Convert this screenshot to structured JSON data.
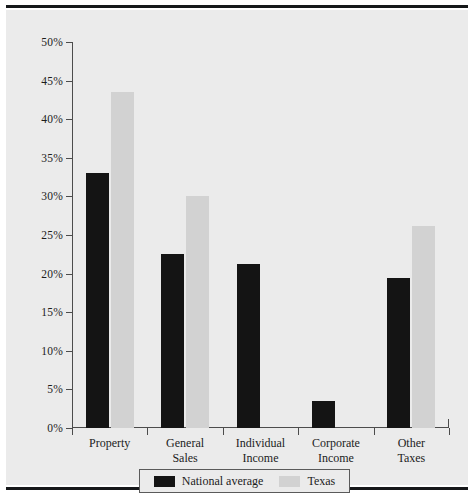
{
  "chart_data": {
    "type": "bar",
    "title": "",
    "subtitle": "",
    "xlabel": "",
    "ylabel": "",
    "categories": [
      "Property",
      "General Sales",
      "Individual Income",
      "Corporate Income",
      "Other Taxes"
    ],
    "category_lines": [
      [
        "Property"
      ],
      [
        "General",
        "Sales"
      ],
      [
        "Individual",
        "Income"
      ],
      [
        "Corporate",
        "Income"
      ],
      [
        "Other",
        "Taxes"
      ]
    ],
    "series": [
      {
        "name": "National average",
        "color": "#141414",
        "values": [
          33.0,
          22.5,
          21.3,
          3.5,
          19.4
        ]
      },
      {
        "name": "Texas",
        "color": "#d2d2d2",
        "values": [
          43.5,
          30.0,
          0,
          0,
          26.2
        ]
      }
    ],
    "ylim": [
      0,
      50
    ],
    "ytick_values": [
      0,
      5,
      10,
      15,
      20,
      25,
      30,
      35,
      40,
      45,
      50
    ],
    "ytick_labels": [
      "0%",
      "5%",
      "10%",
      "15%",
      "20%",
      "25%",
      "30%",
      "35%",
      "40%",
      "45%",
      "50%"
    ],
    "grid": false,
    "legend_position": "bottom",
    "value_suffix": "%"
  },
  "legend": {
    "entries": [
      {
        "label": "National average",
        "swatch": "nat"
      },
      {
        "label": "Texas",
        "swatch": "tex"
      }
    ]
  },
  "colors": {
    "national_average": "#141414",
    "texas": "#d2d2d2",
    "panel_background": "#ebebeb",
    "axis": "#4c4c4c",
    "rule": "#16181a"
  }
}
